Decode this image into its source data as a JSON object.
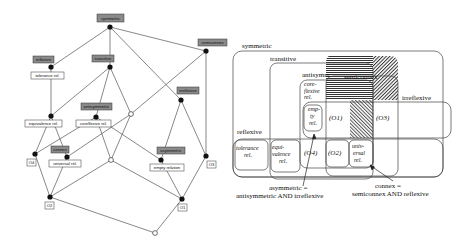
{
  "lattice": {
    "title": "Lattice of relation properties",
    "nodes": [
      {
        "id": "symmetric",
        "label": "symmetric",
        "kind": "attribute",
        "x": 110,
        "y": 27
      },
      {
        "id": "reflexive",
        "label": "reflexive",
        "kind": "attribute",
        "x": 51,
        "y": 67
      },
      {
        "id": "transitive",
        "label": "transitive",
        "kind": "attribute",
        "x": 110,
        "y": 67
      },
      {
        "id": "semiconnex",
        "label": "semiconnex",
        "kind": "attribute",
        "x": 206,
        "y": 51
      },
      {
        "id": "irreflexive",
        "label": "irreflexive",
        "kind": "attribute",
        "x": 181,
        "y": 100
      },
      {
        "id": "antisymmetric",
        "label": "antisymmetric",
        "kind": "attribute",
        "x": 96,
        "y": 115
      },
      {
        "id": "connex",
        "label": "connex",
        "kind": "attribute",
        "x": 67,
        "y": 157
      },
      {
        "id": "asymmetric",
        "label": "asymmetric",
        "kind": "attribute",
        "x": 161,
        "y": 160
      }
    ],
    "object_labels": [
      {
        "id": "tolerance",
        "label": "tolerance rel."
      },
      {
        "id": "equivalence",
        "label": "equivalence rel."
      },
      {
        "id": "coreflexive",
        "label": "coreflexive rel."
      },
      {
        "id": "universal",
        "label": "universal rel."
      },
      {
        "id": "empty",
        "label": "empty relation"
      },
      {
        "id": "O4",
        "label": "O4"
      },
      {
        "id": "O3",
        "label": "O3"
      },
      {
        "id": "O2",
        "label": "O2"
      },
      {
        "id": "O1",
        "label": "O1"
      }
    ]
  },
  "venn": {
    "sets": {
      "symmetric": "symmetric",
      "transitive": "transitive",
      "antisymm": "antisymm.",
      "semiconnex": "semiconnex",
      "irreflexive": "irreflexive",
      "reflexive": "reflexive"
    },
    "regions": {
      "coreflexive": [
        "core-",
        "flexive",
        "rel."
      ],
      "empty": [
        "emp-",
        "ty",
        "rel."
      ],
      "O1": "(O1)",
      "O3": "(O3)",
      "tolerance": [
        "tolerance",
        "rel."
      ],
      "equivalence": [
        "equi-",
        "valence",
        "rel."
      ],
      "O4": "(O4)",
      "O2": "(O2)",
      "universal": [
        "univ-",
        "ersal",
        "rel."
      ]
    },
    "annotations": {
      "asymmetric_line1": "asymmetric =",
      "asymmetric_line2": "antisymmetric AND irreflexive",
      "connex_line1": "connex =",
      "connex_line2": "semiconnex AND reflexive"
    }
  },
  "colors": {
    "attr_fill": "#8a8a8a",
    "line": "#555555",
    "node": "#111111"
  }
}
